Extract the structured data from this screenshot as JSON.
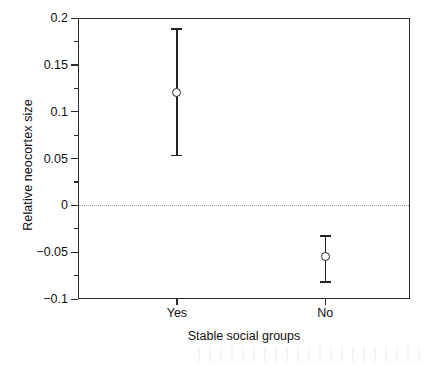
{
  "chart_data": {
    "type": "scatter",
    "title": "",
    "xlabel": "Stable social groups",
    "ylabel": "Relative neocortex size",
    "categories": [
      "Yes",
      "No"
    ],
    "values": [
      0.12,
      -0.055
    ],
    "error_upper": [
      0.189,
      -0.032
    ],
    "error_lower": [
      0.054,
      -0.081
    ],
    "ylim": [
      -0.1,
      0.2
    ],
    "ytick_labels": [
      "0.2",
      "0.15",
      "0.1",
      "0.05",
      "0",
      "-0.05",
      "-0.1"
    ],
    "ytick_values": [
      0.2,
      0.15,
      0.1,
      0.05,
      0,
      -0.05,
      -0.1
    ],
    "yminor_values": [
      0.175,
      0.125,
      0.075,
      0.025,
      -0.025,
      -0.075
    ],
    "grid": false,
    "legend": "none",
    "reference_line": 0,
    "reference_line_style": "dotted",
    "marker": "open-circle",
    "series": [
      {
        "name": "Relative neocortex size",
        "points": [
          {
            "category": "Yes",
            "value": 0.12,
            "upper": 0.189,
            "lower": 0.054
          },
          {
            "category": "No",
            "value": -0.055,
            "upper": -0.032,
            "lower": -0.081
          }
        ]
      }
    ],
    "colors": {
      "axis": "#2a2a2a",
      "marker": "#242424",
      "reference_line": "#9a9a9a",
      "background": "#ffffff"
    }
  }
}
